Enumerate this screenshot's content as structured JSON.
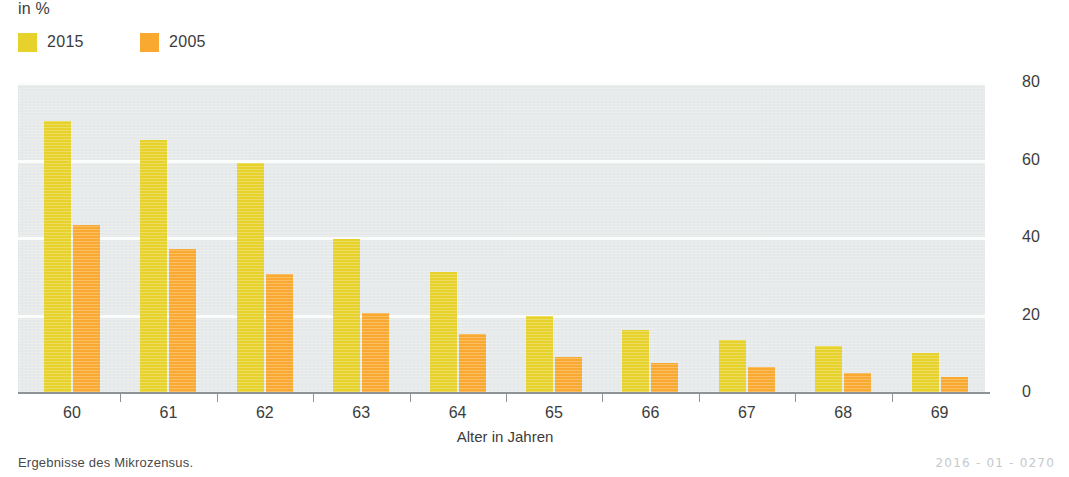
{
  "unit_label": "in %",
  "legend": {
    "items": [
      {
        "label": "2015",
        "color": "#e6d22b",
        "swatch_name": "legend-swatch-2015"
      },
      {
        "label": "2005",
        "color": "#f9a92f",
        "swatch_name": "legend-swatch-2005"
      }
    ]
  },
  "axis": {
    "x_title": "Alter in Jahren",
    "y_ticks": [
      "0",
      "20",
      "40",
      "60",
      "80"
    ]
  },
  "footer": {
    "source_note": "Ergebnisse des Mikrozensus.",
    "doc_code": "2016 - 01 - 0270"
  },
  "colors": {
    "series_2015": "#e6d22b",
    "series_2005": "#f9a92f",
    "plot_background": "#e7eaea",
    "gridline": "#fbfcfc",
    "axis_line": "#8f9396",
    "text": "#3c3c3c",
    "doc_code": "#c6c9cb"
  },
  "chart_data": {
    "type": "bar",
    "title": "",
    "subtitle": "",
    "xlabel": "Alter in Jahren",
    "ylabel": "in %",
    "ylim": [
      0,
      80
    ],
    "ytick_step": 20,
    "grid": true,
    "legend_position": "top-left",
    "categories": [
      "60",
      "61",
      "62",
      "63",
      "64",
      "65",
      "66",
      "67",
      "68",
      "69"
    ],
    "series": [
      {
        "name": "2015",
        "color": "#e6d22b",
        "values": [
          70,
          65,
          59,
          39.5,
          31,
          19.5,
          16,
          13.5,
          12,
          10
        ]
      },
      {
        "name": "2005",
        "color": "#f9a92f",
        "values": [
          43,
          37,
          30.5,
          20.5,
          15,
          9,
          7.5,
          6.5,
          5,
          4
        ]
      }
    ]
  }
}
